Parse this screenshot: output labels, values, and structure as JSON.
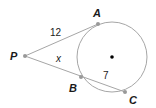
{
  "figure": {
    "points": {
      "P": "P",
      "A": "A",
      "B": "B",
      "C": "C"
    },
    "segment_labels": {
      "PA": "12",
      "PB": "x",
      "BC": "7"
    },
    "colors": {
      "line": "#a6a6a6",
      "point": "#999999",
      "center": "#000000",
      "text": "#1a1a1a"
    }
  }
}
